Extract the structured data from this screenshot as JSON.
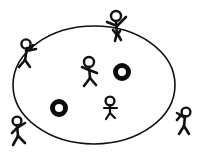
{
  "image": {
    "title": "Stick figures around an ellipse",
    "background_color": "#ffffff",
    "ink_color": "#111111",
    "width": 200,
    "height": 154
  },
  "scene": {
    "ellipse": {
      "label": "large ellipse outline",
      "center_x": 94,
      "center_y": 85,
      "radius_x": 81,
      "radius_y": 59,
      "stroke_color": "#111111",
      "stroke_width": 1.6,
      "fill": "none"
    },
    "rings": [
      {
        "label": "thick black ring right",
        "center_x": 122,
        "center_y": 72,
        "outer_radius": 9,
        "inner_radius": 4,
        "color": "#0b0b0b"
      },
      {
        "label": "thick black ring left",
        "center_x": 59,
        "center_y": 108,
        "outer_radius": 9,
        "inner_radius": 4,
        "color": "#0b0b0b"
      }
    ],
    "figures": [
      {
        "id": "figure-top",
        "label": "stick figure standing on top edge with arms outstretched",
        "position": "top",
        "inside_ellipse": false
      },
      {
        "id": "figure-upper-left",
        "label": "stick figure leaning on upper left edge",
        "position": "upper-left",
        "inside_ellipse": false
      },
      {
        "id": "figure-center-upper",
        "label": "stick figure dancing inside ellipse upper center",
        "position": "center-upper",
        "inside_ellipse": true
      },
      {
        "id": "figure-center-lower",
        "label": "small stick figure inside ellipse lower center",
        "position": "center-lower",
        "inside_ellipse": true
      },
      {
        "id": "figure-bottom-left",
        "label": "stick figure outside lower left reaching up",
        "position": "bottom-left",
        "inside_ellipse": false
      },
      {
        "id": "figure-right",
        "label": "stick figure outside right leaning toward ellipse",
        "position": "right",
        "inside_ellipse": false
      }
    ]
  }
}
